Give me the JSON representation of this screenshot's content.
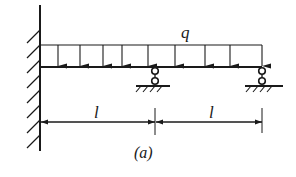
{
  "figure": {
    "caption": "(a)",
    "load_label": "q",
    "span_labels": [
      "l",
      "l"
    ],
    "colors": {
      "ink": "#1a1a1a",
      "background": "#ffffff"
    },
    "elements": {
      "fixed_support": "left wall (clamped)",
      "distributed_load": "uniform load q over full beam",
      "supports": [
        "roller support at mid (x = l)",
        "roller support at right end (x = 2l)"
      ]
    }
  }
}
